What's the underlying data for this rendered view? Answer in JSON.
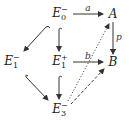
{
  "diagram": {
    "type": "commutative-diagram",
    "nodes": [
      {
        "id": "E0m",
        "base": "E",
        "sub": "0",
        "sup": "−",
        "x": 60,
        "y": 14
      },
      {
        "id": "A",
        "base": "A",
        "sub": "",
        "sup": "",
        "x": 113,
        "y": 14
      },
      {
        "id": "E1m",
        "base": "E",
        "sub": "1",
        "sup": "−",
        "x": 12,
        "y": 62
      },
      {
        "id": "E1p",
        "base": "E",
        "sub": "1",
        "sup": "+",
        "x": 60,
        "y": 62
      },
      {
        "id": "B",
        "base": "B",
        "sub": "",
        "sup": "",
        "x": 113,
        "y": 62
      },
      {
        "id": "E3m",
        "base": "E",
        "sub": "3",
        "sup": "−",
        "x": 60,
        "y": 110
      }
    ],
    "edges": [
      {
        "from": "E0m",
        "to": "A",
        "label": "a",
        "style": "solid"
      },
      {
        "from": "A",
        "to": "B",
        "label": "p",
        "style": "solid-double-head"
      },
      {
        "from": "E1p",
        "to": "B",
        "label": "b",
        "style": "solid"
      },
      {
        "from": "E0m",
        "to": "E1m",
        "label": "",
        "style": "hook"
      },
      {
        "from": "E0m",
        "to": "E1p",
        "label": "",
        "style": "hook"
      },
      {
        "from": "E1m",
        "to": "E3m",
        "label": "",
        "style": "hook"
      },
      {
        "from": "E1p",
        "to": "E3m",
        "label": "",
        "style": "hook"
      },
      {
        "from": "E3m",
        "to": "A",
        "label": "",
        "style": "dotted"
      },
      {
        "from": "E3m",
        "to": "B",
        "label": "",
        "style": "dashed"
      }
    ],
    "labels": {
      "a": "a",
      "b": "b",
      "p": "p"
    }
  }
}
